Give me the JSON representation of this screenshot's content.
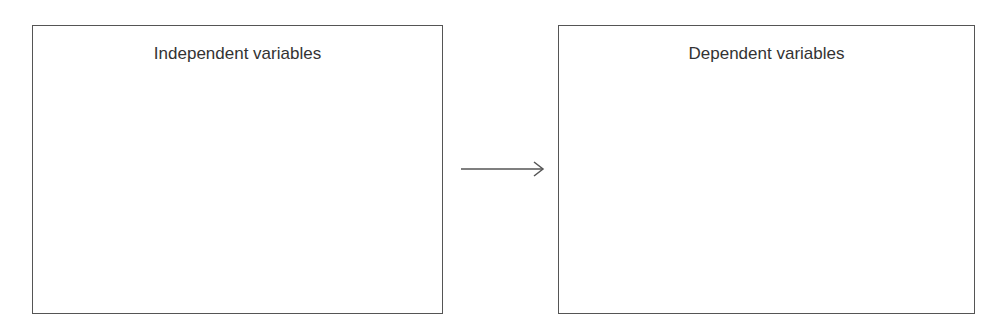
{
  "diagram": {
    "nodes": [
      {
        "id": "independent",
        "label": "Independent variables"
      },
      {
        "id": "dependent",
        "label": "Dependent variables"
      }
    ],
    "edges": [
      {
        "from": "independent",
        "to": "dependent",
        "style": "arrow"
      }
    ],
    "colors": {
      "stroke": "#555555",
      "text": "#333333",
      "background": "#ffffff"
    }
  }
}
